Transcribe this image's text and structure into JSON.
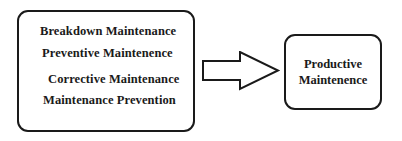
{
  "diagram": {
    "source_box": {
      "items": [
        "Breakdown Maintenance",
        "Preventive Maintenence",
        "Corrective Maintenance",
        "Maintenance Prevention"
      ]
    },
    "arrow": {
      "direction": "right",
      "style": "outlined-block-arrow"
    },
    "target_box": {
      "lines": [
        "Productive",
        "Maintenence"
      ]
    }
  }
}
